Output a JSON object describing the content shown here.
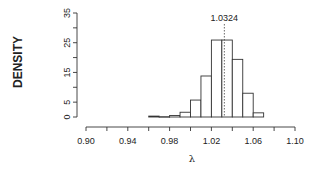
{
  "chart_data": {
    "type": "bar",
    "subtype": "histogram",
    "title": "",
    "xlabel": "λ",
    "ylabel": "DENSITY",
    "xlim": [
      0.9,
      1.1
    ],
    "ylim": [
      0,
      35
    ],
    "x_ticks": [
      0.9,
      0.92,
      0.94,
      0.96,
      0.98,
      1.0,
      1.02,
      1.04,
      1.06,
      1.08,
      1.1
    ],
    "x_tick_labels": [
      "0.90",
      "0.94",
      "0.98",
      "1.02",
      "1.06",
      "1.10"
    ],
    "x_tick_label_values": [
      0.9,
      0.94,
      0.98,
      1.02,
      1.06,
      1.1
    ],
    "y_ticks": [
      0,
      5,
      10,
      15,
      20,
      25,
      30,
      35
    ],
    "y_tick_labels": [
      "0",
      "5",
      "15",
      "25",
      "35"
    ],
    "y_tick_label_values": [
      0,
      5,
      15,
      25,
      35
    ],
    "bin_width": 0.01,
    "bins": [
      {
        "start": 0.96,
        "end": 0.97,
        "density": 0.3
      },
      {
        "start": 0.97,
        "end": 0.98,
        "density": 0.1
      },
      {
        "start": 0.98,
        "end": 0.99,
        "density": 0.5
      },
      {
        "start": 0.99,
        "end": 1.0,
        "density": 1.6
      },
      {
        "start": 1.0,
        "end": 1.01,
        "density": 5.7
      },
      {
        "start": 1.01,
        "end": 1.02,
        "density": 13.8
      },
      {
        "start": 1.02,
        "end": 1.03,
        "density": 25.9
      },
      {
        "start": 1.03,
        "end": 1.04,
        "density": 25.9
      },
      {
        "start": 1.04,
        "end": 1.05,
        "density": 19.4
      },
      {
        "start": 1.05,
        "end": 1.06,
        "density": 8.0
      },
      {
        "start": 1.06,
        "end": 1.07,
        "density": 1.4
      }
    ],
    "categories": [
      "0.96",
      "0.97",
      "0.98",
      "0.99",
      "1.00",
      "1.01",
      "1.02",
      "1.03",
      "1.04",
      "1.05",
      "1.06"
    ],
    "values": [
      0.3,
      0.1,
      0.5,
      1.6,
      5.7,
      13.8,
      25.9,
      25.9,
      19.4,
      8.0,
      1.4
    ],
    "annotations": [
      {
        "type": "vline",
        "x": 1.0324,
        "style": "dotted",
        "label": "1.0324"
      }
    ],
    "grid": false,
    "legend": null
  },
  "layout": {
    "plot": {
      "x0": 86,
      "x1": 295,
      "y_zero": 117,
      "y_top": 13,
      "x_axis_y": 127,
      "y_axis_x": 77
    }
  }
}
